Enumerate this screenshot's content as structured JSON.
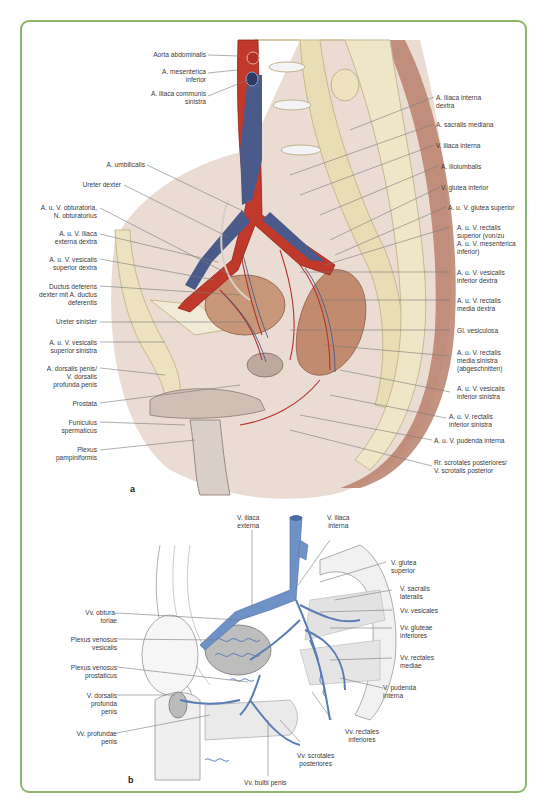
{
  "figure": {
    "frame_color": "#8db56b",
    "colors": {
      "artery": "#c0392b",
      "vein_top": "#4a5a8a",
      "vein_bottom": "#6f92c6",
      "bone": "#e8ddb5",
      "muscle": "#b9806b",
      "leader": "#777777"
    },
    "panel_a": {
      "label": "a",
      "left_labels": [
        "Aorta abdominalis",
        "A. mesenterica\ninferior",
        "A. iliaca communis\nsinistra",
        "A. umbilicalis",
        "Ureter dexter",
        "A. u. V. obturatoria,\nN. obturatorius",
        "A. u. V. iliaca\nexterna dextra",
        "A. u. V. vesicalis\nsuperior dextra",
        "Ductus deferens\ndexter mit A. ductus\ndeferentis",
        "Ureter sinister",
        "A. u. V. vesicalis\nsuperior sinistra",
        "A. dorsalis penis/\nV. dorsalis\nprofunda penis",
        "Prostata",
        "Funiculus\nspermaticus",
        "Plexus\npampiniformis"
      ],
      "right_labels": [
        "A. iliaca interna\ndextra",
        "A. sacralis mediana",
        "V. iliaca interna",
        "A. iliolumbalis",
        "V. glutea inferior",
        "A. u. V. glutea superior",
        "A. u. V. rectalis\nsuperior (von/zu\nA. u. V. mesenterica\ninferior)",
        "A. u. V. vesicalis\ninferior dextra",
        "A. u. V. rectalis\nmedia dextra",
        "Gl. vesiculosa",
        "A. u. V. rectalis\nmedia sinistra\n(abgeschnitten)",
        "A. u. V. vesicalis\ninferior sinistra",
        "A. u. V. rectalis\ninferior sinistra",
        "A. u. V. pudenda interna",
        "Rr. scrotales posteriores/\nV. scrotalis posterior"
      ]
    },
    "panel_b": {
      "label": "b",
      "top_labels": [
        "V. iliaca\nexterna",
        "V. iliaca\ninterna"
      ],
      "left_labels": [
        "Vv. obtura-\ntoriae",
        "Plexus venosus\nvesicalis",
        "Plexus venosus\nprostaticus",
        "V. dorsalis\nprofunda\npenis",
        "Vv. profundae\npenis"
      ],
      "right_labels": [
        "V. glutea\nsuperior",
        "V. sacralis\nlateralis",
        "Vv. vesicales",
        "Vv. gluteae\ninferiores",
        "Vv. rectales\nmediae",
        "V. pudenda\ninterna"
      ],
      "bottom_labels": [
        "Vv. rectales\ninferiores",
        "Vv. scrotales\nposteriores",
        "Vv. bulbi penis"
      ]
    }
  }
}
